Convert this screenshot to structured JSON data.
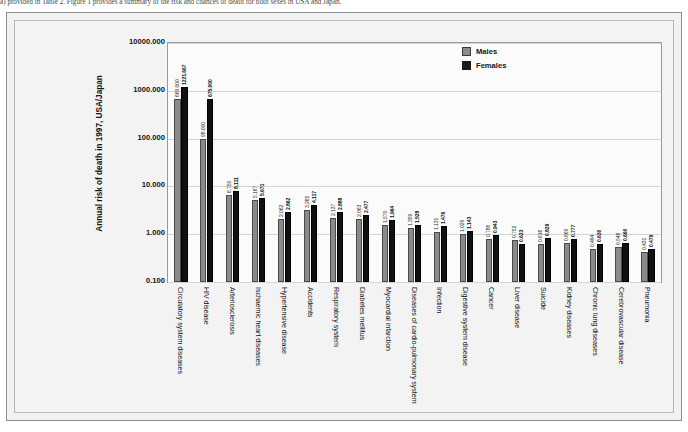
{
  "caption": "a) provided in Table 2. Figure 1 provides a summary of the risk and chances of death for both sexes in USA and Japan.",
  "legend": {
    "items": [
      {
        "label": "Males",
        "color": "#8a8a8a"
      },
      {
        "label": "Females",
        "color": "#111111"
      }
    ]
  },
  "axis": {
    "y_title": "Annual risk of death in 1997, USA/Japan",
    "y_ticks": [
      "10000.000",
      "1000.000",
      "100.000",
      "10.000",
      "1.000",
      "0.100"
    ]
  },
  "chart_data": {
    "type": "bar",
    "title": "",
    "xlabel": "",
    "ylabel": "Annual risk of death in 1997, USA/Japan",
    "yscale": "log",
    "ylim": [
      0.1,
      10000
    ],
    "grid": true,
    "legend_position": "top-right",
    "categories": [
      "Circulatory system diseases",
      "HIV disease",
      "Arteriosclerosis",
      "Ischaemic heart diseases",
      "Hypertensive disease",
      "Accidents",
      "Respiratory system",
      "Diabetes mellitus",
      "Myocardial infarction",
      "Diseases of cardio-pulmonary system",
      "Infection",
      "Digestive system disease",
      "Cancer",
      "Liver disease",
      "Suicide",
      "Kidney diseases",
      "Chronic lung diseases",
      "Cerebrovascular disease",
      "Pneumonia"
    ],
    "series": [
      {
        "name": "Males",
        "color": "#8a8a8a",
        "values": [
          669.0,
          98.0,
          6.75,
          5.167,
          2.062,
          3.265,
          2.137,
          2.063,
          1.57,
          1.359,
          1.131,
          1.029,
          0.786,
          0.752,
          0.616,
          0.669,
          0.494,
          0.548,
          0.431
        ],
        "labels": [
          "669.000",
          "98.000",
          "6.750",
          "5.167",
          "2.062",
          "3.265",
          "2.137",
          "2.063",
          "1.570",
          "1.359",
          "1.131",
          "1.029",
          "0.786",
          "0.752",
          "0.616",
          "0.669",
          "0.494",
          "0.548",
          "0.431"
        ]
      },
      {
        "name": "Females",
        "color": "#111111",
        "values": [
          1221.667,
          675.0,
          8.111,
          5.671,
          2.862,
          4.117,
          2.888,
          2.477,
          1.964,
          1.528,
          1.476,
          1.143,
          0.943,
          0.623,
          0.829,
          0.777,
          0.63,
          0.66,
          0.479
        ],
        "labels": [
          "1221.667",
          "675.000",
          "8.111",
          "5.671",
          "2.862",
          "4.117",
          "2.888",
          "2.477",
          "1.964",
          "1.528",
          "1.476",
          "1.143",
          "0.943",
          "0.623",
          "0.829",
          "0.777",
          "0.630",
          "0.660",
          "0.479"
        ]
      }
    ]
  }
}
